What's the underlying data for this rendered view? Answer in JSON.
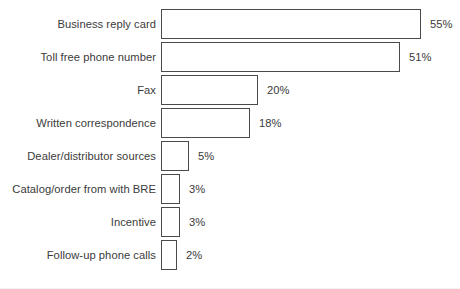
{
  "chart_data": {
    "type": "bar",
    "orientation": "horizontal",
    "title": "",
    "subtitle": "",
    "xlabel": "",
    "ylabel": "",
    "xlim": [
      0,
      55
    ],
    "grid": false,
    "legend": null,
    "value_suffix": "%",
    "categories": [
      "Business reply card",
      "Toll free phone number",
      "Fax",
      "Written correspondence",
      "Dealer/distributor sources",
      "Catalog/order from with BRE",
      "Incentive",
      "Follow-up phone calls"
    ],
    "values": [
      55,
      51,
      20,
      18,
      5,
      3,
      3,
      2
    ],
    "value_labels": [
      "55%",
      "51%",
      "20%",
      "18%",
      "5%",
      "3%",
      "3%",
      "2%"
    ],
    "bar_pixel_widths": [
      260,
      239,
      97,
      89,
      28,
      19,
      19,
      16
    ],
    "colors": {
      "bar_fill": "#ffffff",
      "bar_stroke": "#4a4a4a",
      "text": "#3b3b3b",
      "background": "#ffffff"
    }
  },
  "rows": [
    {
      "label": "Business reply card",
      "value_label": "55%",
      "width": "260px"
    },
    {
      "label": "Toll free phone number",
      "value_label": "51%",
      "width": "239px"
    },
    {
      "label": "Fax",
      "value_label": "20%",
      "width": "97px"
    },
    {
      "label": "Written correspondence",
      "value_label": "18%",
      "width": "89px"
    },
    {
      "label": "Dealer/distributor sources",
      "value_label": "5%",
      "width": "28px"
    },
    {
      "label": "Catalog/order from with BRE",
      "value_label": "3%",
      "width": "19px"
    },
    {
      "label": "Incentive",
      "value_label": "3%",
      "width": "19px"
    },
    {
      "label": "Follow-up phone calls",
      "value_label": "2%",
      "width": "16px"
    }
  ]
}
